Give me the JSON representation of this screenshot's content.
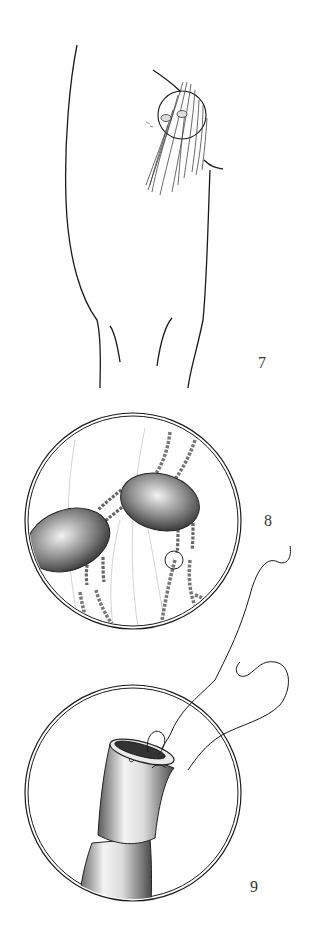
{
  "figures": [
    {
      "number": "7",
      "subject": "leg-with-hairs-magnified-region"
    },
    {
      "number": "8",
      "subject": "magnified-lice-on-hair-shafts"
    },
    {
      "number": "9",
      "subject": "hair-shaft-with-looped-thread"
    }
  ],
  "colors": {
    "ink": "#1a1a1a",
    "shade": "#555555",
    "light": "#bbbbbb",
    "background": "#ffffff"
  }
}
